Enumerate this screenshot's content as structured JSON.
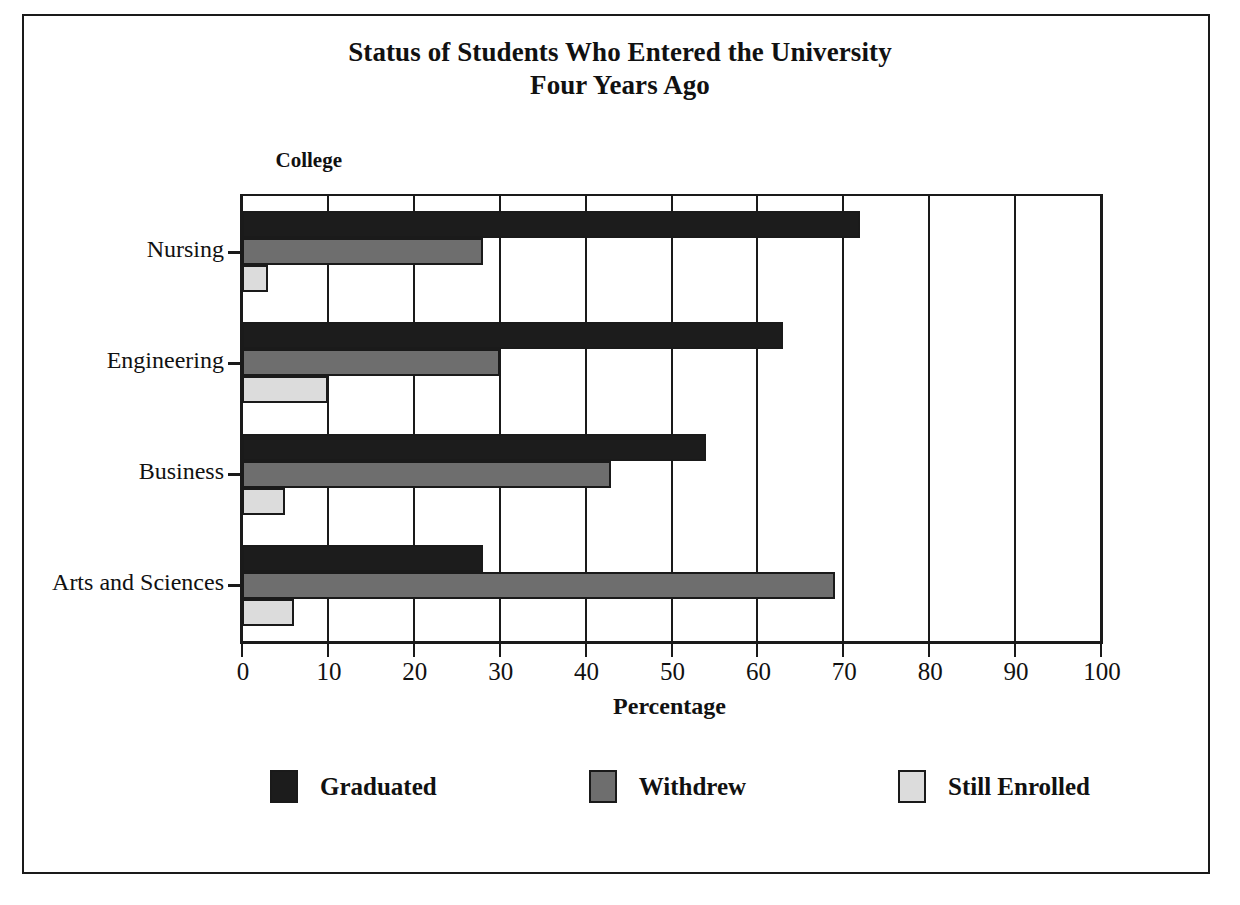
{
  "figure": {
    "title_line1": "Status of Students Who Entered the University",
    "title_line2": "Four Years Ago",
    "category_axis_header": "College"
  },
  "legend": {
    "position": "bottom",
    "items": [
      {
        "label": "Graduated",
        "color": "#1c1c1c",
        "swatch": "dark-fill"
      },
      {
        "label": "Withdrew",
        "color": "#6e6e6e",
        "swatch": "medium-gray-fill"
      },
      {
        "label": "Still Enrolled",
        "color": "#dcdcdc",
        "swatch": "light-gray-fill"
      }
    ]
  },
  "chart_data": {
    "type": "bar",
    "orientation": "horizontal",
    "title": "Status of Students Who Entered the University Four Years Ago",
    "xlabel": "Percentage",
    "ylabel": "College",
    "xlim": [
      0,
      100
    ],
    "xticks": [
      0,
      10,
      20,
      30,
      40,
      50,
      60,
      70,
      80,
      90,
      100
    ],
    "xtick_labels": [
      "0",
      "10",
      "20",
      "30",
      "40",
      "50",
      "60",
      "70",
      "80",
      "90",
      "100"
    ],
    "grid": true,
    "grid_axis": "x",
    "legend_position": "bottom",
    "categories": [
      "Nursing",
      "Engineering",
      "Business",
      "Arts and Sciences"
    ],
    "series": [
      {
        "name": "Graduated",
        "color": "#1c1c1c",
        "values": [
          72,
          63,
          54,
          28
        ]
      },
      {
        "name": "Withdrew",
        "color": "#6e6e6e",
        "values": [
          28,
          30,
          43,
          69
        ]
      },
      {
        "name": "Still Enrolled",
        "color": "#dcdcdc",
        "values": [
          3,
          10,
          5,
          6
        ]
      }
    ]
  }
}
